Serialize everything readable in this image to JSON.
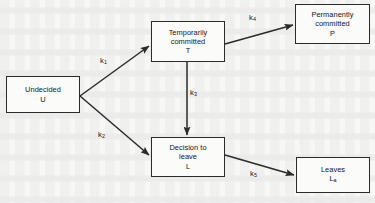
{
  "diagram": {
    "type": "state-transition-flow",
    "background_color": "#f7f7f6",
    "stroke_color": "#2b2b2b",
    "nodes": [
      {
        "id": "U",
        "name": "undecided",
        "lines": [
          "Undecided"
        ],
        "symbol": "U",
        "box": {
          "x": 6,
          "y": 76,
          "w": 74,
          "h": 37
        }
      },
      {
        "id": "T",
        "name": "temporarily-committed",
        "lines": [
          "Temporarily",
          "committed"
        ],
        "symbol": "T",
        "box": {
          "x": 151,
          "y": 21,
          "w": 74,
          "h": 41
        }
      },
      {
        "id": "P",
        "name": "permanently-committed",
        "lines": [
          "Permanently",
          "committed"
        ],
        "symbol": "P",
        "box": {
          "x": 295,
          "y": 4,
          "w": 75,
          "h": 40
        }
      },
      {
        "id": "L",
        "name": "decision-to-leave",
        "lines": [
          "Decision to",
          "leave"
        ],
        "symbol": "L",
        "box": {
          "x": 151,
          "y": 137,
          "w": 74,
          "h": 40
        }
      },
      {
        "id": "La",
        "name": "leaves",
        "lines": [
          "Leaves"
        ],
        "symbol": "L",
        "symbol_subscript": "a",
        "box": {
          "x": 296,
          "y": 157,
          "w": 74,
          "h": 36
        }
      }
    ],
    "edges": [
      {
        "id": "k1",
        "name": "undecided-to-temporarily-committed",
        "from": "U",
        "to": "T",
        "label": "k",
        "label_subscript": "1",
        "label_pos": {
          "x": 100,
          "y": 57
        },
        "path": {
          "x1": 80,
          "y1": 96,
          "x2": 149,
          "y2": 46
        }
      },
      {
        "id": "k2",
        "name": "undecided-to-decision-to-leave",
        "from": "U",
        "to": "L",
        "label": "k",
        "label_subscript": "2",
        "label_pos": {
          "x": 98,
          "y": 131
        },
        "path": {
          "x1": 80,
          "y1": 96,
          "x2": 149,
          "y2": 155
        }
      },
      {
        "id": "k3",
        "name": "temporarily-committed-to-decision-to-leave",
        "from": "T",
        "to": "L",
        "label": "k",
        "label_subscript": "3",
        "label_pos": {
          "x": 190,
          "y": 89
        },
        "path": {
          "x1": 187,
          "y1": 62,
          "x2": 187,
          "y2": 135
        }
      },
      {
        "id": "k4",
        "name": "temporarily-committed-to-permanently-committed",
        "from": "T",
        "to": "P",
        "label": "k",
        "label_subscript": "4",
        "label_pos": {
          "x": 249,
          "y": 14
        },
        "path": {
          "x1": 225,
          "y1": 44,
          "x2": 293,
          "y2": 25
        }
      },
      {
        "id": "k5",
        "name": "decision-to-leave-to-leaves",
        "from": "L",
        "to": "La",
        "label": "k",
        "label_subscript": "5",
        "label_pos": {
          "x": 250,
          "y": 170
        },
        "path": {
          "x1": 225,
          "y1": 155,
          "x2": 294,
          "y2": 175
        }
      }
    ]
  }
}
